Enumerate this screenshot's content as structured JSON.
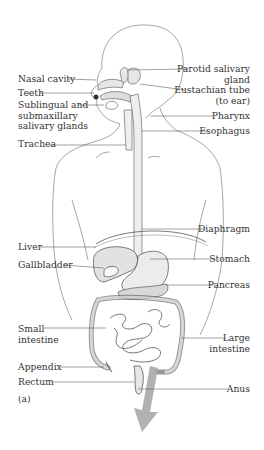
{
  "figure": {
    "panel_label": "(a)",
    "arrow_color": "#a9a9a9",
    "line_color": "#555555",
    "labels_left": [
      {
        "id": "nasal-cavity",
        "text": "Nasal cavity"
      },
      {
        "id": "teeth",
        "text": "Teeth"
      },
      {
        "id": "sublingual",
        "lines": [
          "Sublingual and",
          "submaxillary",
          "salivary glands"
        ]
      },
      {
        "id": "trachea",
        "text": "Trachea"
      },
      {
        "id": "liver",
        "text": "Liver"
      },
      {
        "id": "gallbladder",
        "text": "Gallbladder"
      },
      {
        "id": "small-intestine",
        "lines": [
          "Small",
          "intestine"
        ]
      },
      {
        "id": "appendix",
        "text": "Appendix"
      },
      {
        "id": "rectum",
        "text": "Rectum"
      }
    ],
    "labels_right": [
      {
        "id": "parotid",
        "lines": [
          "Parotid salivary",
          "gland"
        ]
      },
      {
        "id": "eustachian",
        "lines": [
          "Eustachian tube",
          "(to ear)"
        ]
      },
      {
        "id": "pharynx",
        "text": "Pharynx"
      },
      {
        "id": "esophagus",
        "text": "Esophagus"
      },
      {
        "id": "diaphragm",
        "text": "Diaphragm"
      },
      {
        "id": "stomach",
        "text": "Stomach"
      },
      {
        "id": "pancreas",
        "text": "Pancreas"
      },
      {
        "id": "large-intestine",
        "lines": [
          "Large",
          "intestine"
        ]
      },
      {
        "id": "anus",
        "text": "Anus"
      }
    ]
  }
}
